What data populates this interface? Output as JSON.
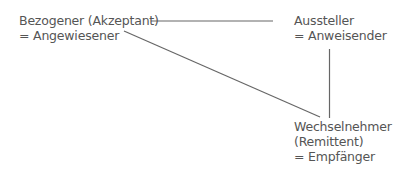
{
  "diagram": {
    "nodes": [
      {
        "id": "bezogener",
        "lines": [
          "Bezogener (Akzeptant)",
          "= Angewiesener"
        ]
      },
      {
        "id": "aussteller",
        "lines": [
          "Aussteller",
          "= Anweisender"
        ]
      },
      {
        "id": "wechselnehmer",
        "lines": [
          "Wechselnehmer",
          "(Remittent)",
          "= Empfänger"
        ]
      }
    ],
    "edges": [
      {
        "from": "bezogener",
        "to": "aussteller"
      },
      {
        "from": "bezogener",
        "to": "wechselnehmer"
      },
      {
        "from": "aussteller",
        "to": "wechselnehmer"
      }
    ],
    "colors": {
      "text": "#555555",
      "line": "#666666",
      "background": "#ffffff"
    }
  }
}
